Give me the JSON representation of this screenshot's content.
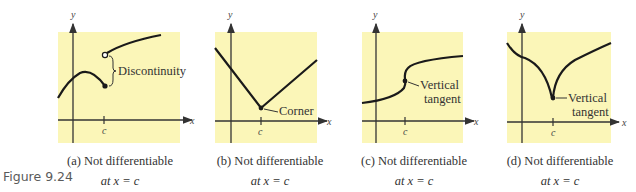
{
  "figure_label": "Figure 9.24",
  "colors": {
    "panel_bg": "#fbf6b8",
    "curve": "#1a1a1a",
    "axis": "#333333"
  },
  "panels": [
    {
      "id": "a",
      "caption_line1": "(a) Not differentiable",
      "caption_line2": "at x = c",
      "annotation": "Discontinuity",
      "axis_x": "x",
      "axis_y": "y",
      "tick": "c"
    },
    {
      "id": "b",
      "caption_line1": "(b) Not differentiable",
      "caption_line2": "at x = c",
      "annotation": "Corner",
      "axis_x": "x",
      "axis_y": "y",
      "tick": "c"
    },
    {
      "id": "c",
      "caption_line1": "(c) Not differentiable",
      "caption_line2": "at x = c",
      "annotation_line1": "Vertical",
      "annotation_line2": "tangent",
      "axis_x": "x",
      "axis_y": "y",
      "tick": "c"
    },
    {
      "id": "d",
      "caption_line1": "(d) Not differentiable",
      "caption_line2": "at x = c",
      "annotation_line1": "Vertical",
      "annotation_line2": "tangent",
      "axis_x": "x",
      "axis_y": "y",
      "tick": "c"
    }
  ]
}
